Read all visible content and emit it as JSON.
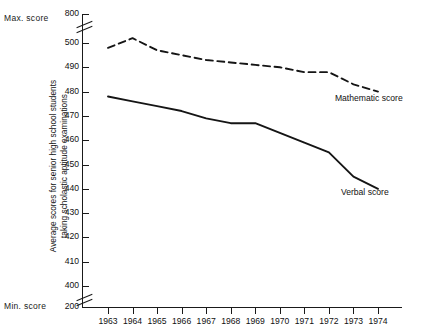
{
  "labels": {
    "max_score": "Max. score",
    "min_score": "Min. score",
    "y_axis_title_line1": "Average scores for senior high school students",
    "y_axis_title_line2": "taking scholastic aptitude examinations"
  },
  "chart_data": {
    "type": "line",
    "title": "",
    "xlabel": "",
    "ylabel": "Average scores for senior high school students taking scholastic aptitude examinations",
    "categories": [
      "1963",
      "1964",
      "1965",
      "1966",
      "1967",
      "1968",
      "1969",
      "1970",
      "1971",
      "1972",
      "1973",
      "1974"
    ],
    "y_tick_labels": [
      "800",
      "500",
      "490",
      "480",
      "470",
      "460",
      "450",
      "440",
      "430",
      "420",
      "410",
      "400",
      "200"
    ],
    "ylim": [
      200,
      800
    ],
    "y_axis_breaks": [
      "between 800 and 500",
      "between 400 and 200"
    ],
    "grid": false,
    "legend": "inline annotations at line ends",
    "series": [
      {
        "name": "Mathematic score",
        "style": "dashed",
        "color": "#151515",
        "values": [
          498,
          502,
          497,
          495,
          493,
          492,
          491,
          490,
          488,
          488,
          483,
          480
        ]
      },
      {
        "name": "Verbal score",
        "style": "solid",
        "color": "#151515",
        "values": [
          478,
          476,
          474,
          472,
          469,
          467,
          467,
          463,
          459,
          455,
          445,
          440
        ]
      }
    ],
    "annotations": [
      {
        "text": "Mathematic score",
        "near_year": "1973"
      },
      {
        "text": "Verbal score",
        "near_year": "1973"
      }
    ]
  }
}
